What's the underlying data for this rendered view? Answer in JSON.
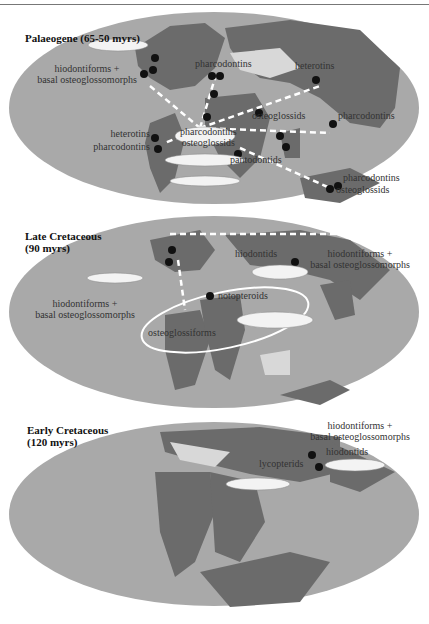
{
  "figure": {
    "panels": [
      {
        "title": "Palaeogene (65-50 myrs)",
        "labels": [
          "hiodontiforms +\nbasal osteoglossomorphs",
          "pharcodontins",
          "heterotins",
          "osteoglossids",
          "pharcodontins",
          "heterotins",
          "pharcodontins",
          "pharcodontins\nosteoglossids",
          "pantodontids",
          "pharcodontins",
          "osteoglossids"
        ]
      },
      {
        "title": "Late Cretaceous\n(90 myrs)",
        "labels": [
          "hiodontids",
          "hiodontiforms +\nbasal osteoglossomorphs",
          "hiodontiforms +\nbasal osteoglossomorphs",
          "notopteroids",
          "osteoglossiforms"
        ]
      },
      {
        "title": "Early Cretaceous\n(120 myrs)",
        "labels": [
          "hiodontiforms +\nbasal osteoglossomorphs",
          "hiodontids",
          "lycopterids"
        ]
      }
    ],
    "colors": {
      "ocean": "#a9a9a9",
      "land": "#6b6b6b",
      "shelf": "#d8d8d8",
      "dot": "#111111",
      "route": "#ffffff"
    }
  }
}
